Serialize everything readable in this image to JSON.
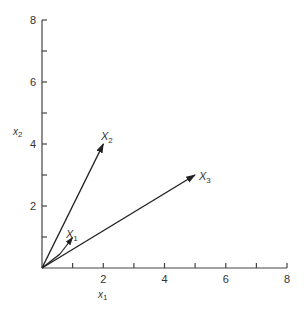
{
  "diagram": {
    "type": "vector-plot",
    "x_axis": {
      "label": "x",
      "label_sub": "1",
      "ticks": [
        2,
        4,
        6,
        8
      ],
      "range": [
        0,
        8
      ]
    },
    "y_axis": {
      "label": "x",
      "label_sub": "2",
      "ticks": [
        2,
        4,
        6,
        8
      ],
      "range": [
        0,
        8
      ]
    },
    "vectors": [
      {
        "name": "X",
        "sub": "1",
        "x": 1,
        "y": 1
      },
      {
        "name": "X",
        "sub": "2",
        "x": 2,
        "y": 4
      },
      {
        "name": "X",
        "sub": "3",
        "x": 4,
        "y": 3
      }
    ],
    "colors": {
      "line": "#222222",
      "axis": "#444444"
    }
  }
}
